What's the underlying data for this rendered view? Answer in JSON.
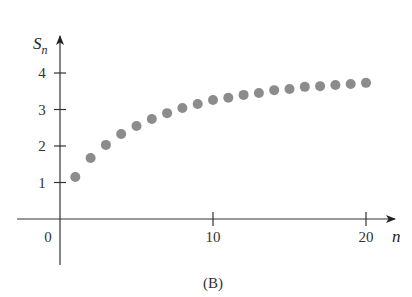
{
  "chart_data": {
    "type": "scatter",
    "title": "",
    "caption": "(B)",
    "xlabel": "n",
    "ylabel": "S",
    "ylabel_subscript": "n",
    "xlim": [
      0,
      21
    ],
    "ylim": [
      0,
      4.5
    ],
    "grid": false,
    "legend": null,
    "x_ticks": [
      10,
      20
    ],
    "x_tick_labels": [
      "10",
      "20"
    ],
    "y_ticks": [
      1,
      2,
      3,
      4
    ],
    "y_tick_labels": [
      "1",
      "2",
      "3",
      "4"
    ],
    "origin_label": "0",
    "marker_color": "#8c8c8c",
    "x": [
      1,
      2,
      3,
      4,
      5,
      6,
      7,
      8,
      9,
      10,
      11,
      12,
      13,
      14,
      15,
      16,
      17,
      18,
      19,
      20
    ],
    "values": [
      1.15,
      1.67,
      2.03,
      2.33,
      2.55,
      2.74,
      2.9,
      3.04,
      3.15,
      3.26,
      3.32,
      3.4,
      3.45,
      3.53,
      3.56,
      3.62,
      3.64,
      3.67,
      3.7,
      3.73
    ]
  }
}
